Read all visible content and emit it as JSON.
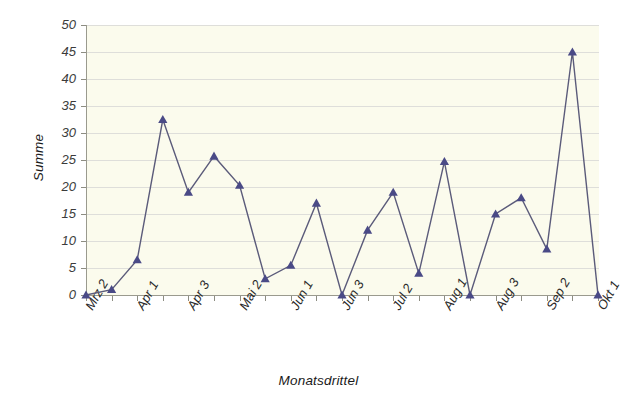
{
  "chart_data": {
    "type": "line",
    "title": "",
    "xlabel": "Monatsdrittel",
    "ylabel": "Summe",
    "ylim": [
      0,
      50
    ],
    "ytick_step": 5,
    "yticks": [
      0,
      5,
      10,
      15,
      20,
      25,
      30,
      35,
      40,
      45,
      50
    ],
    "grid": true,
    "legend": "none",
    "categories": [
      "Mrz 2",
      "Mrz 3",
      "Apr 1",
      "Apr 2",
      "Apr 3",
      "Mai 1",
      "Mai 2",
      "Mai 3",
      "Jun 1",
      "Jun 2",
      "Jun 3",
      "Jul 1",
      "Jul 2",
      "Jul 3",
      "Aug 1",
      "Aug 2",
      "Aug 3",
      "Sep 1",
      "Sep 2",
      "Sep 3",
      "Okt 1"
    ],
    "xtick_labels_shown": [
      "Mrz 2",
      "Apr 1",
      "Apr 3",
      "Mai 2",
      "Jun 1",
      "Jun 3",
      "Jul 2",
      "Aug 1",
      "Aug 3",
      "Sep 2",
      "Okt 1"
    ],
    "values": [
      0,
      1,
      6.5,
      32.5,
      19,
      25.7,
      20.3,
      3,
      5.5,
      17,
      0,
      12,
      19,
      4,
      24.7,
      0,
      15,
      18,
      8.5,
      45,
      0
    ],
    "series": [
      {
        "name": "Summe",
        "marker": "triangle",
        "values": [
          0,
          1,
          6.5,
          32.5,
          19,
          25.7,
          20.3,
          3,
          5.5,
          17,
          0,
          12,
          19,
          4,
          24.7,
          0,
          15,
          18,
          8.5,
          45,
          0
        ]
      }
    ],
    "colors": {
      "line": "#5b5b7a",
      "marker": "#4a4a86",
      "plot_background": "#fbfbed",
      "gridline": "#dededa",
      "axis": "#9a9a8e",
      "text": "#1a1a1a",
      "page_background": "#ffffff"
    }
  }
}
